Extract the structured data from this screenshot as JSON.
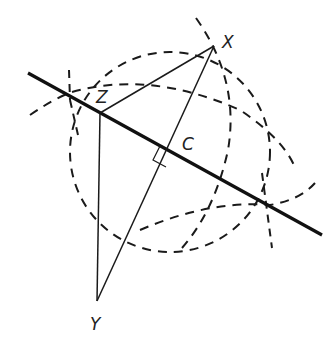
{
  "diagram": {
    "cut_off_header_text": "",
    "points": {
      "X": {
        "label": "X",
        "x": 214,
        "y": 46
      },
      "Y": {
        "label": "Y",
        "x": 97,
        "y": 301
      },
      "Z": {
        "label": "Z",
        "x": 100,
        "y": 113
      },
      "C": {
        "label": "C",
        "x": 173,
        "y": 153
      }
    },
    "perpendicular_line": {
      "x1": 28,
      "y1": 73,
      "x2": 322,
      "y2": 235
    },
    "colors": {
      "stroke": "#1a1a1a",
      "background": "#ffffff"
    }
  }
}
